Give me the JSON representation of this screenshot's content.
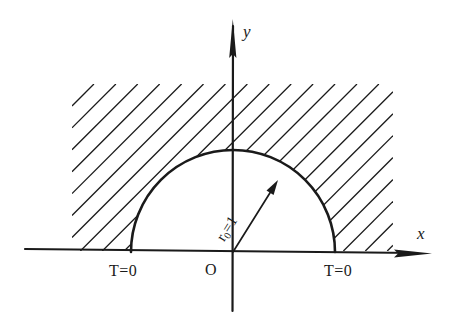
{
  "figure": {
    "type": "geometry-diagram",
    "background_color": "#ffffff",
    "ink_color": "#1a1a1a"
  },
  "axes": {
    "x_axis": {
      "label": "x",
      "arrow": "right-arrow-icon",
      "x_start": 25,
      "x_end": 432,
      "y_at_start": 249,
      "y_at_end": 253,
      "label_x": 417,
      "label_y": 225
    },
    "y_axis": {
      "label": "y",
      "arrow": "up-arrow-icon",
      "x": 233,
      "y_top": 20,
      "y_bottom": 311,
      "label_x": 243,
      "label_y": 23
    },
    "origin": {
      "label": "O",
      "x": 233,
      "y": 252,
      "label_x": 205,
      "label_y": 262
    }
  },
  "semicircle": {
    "center_x": 233,
    "center_y": 252,
    "radius": 102,
    "left_endpoint_x": 131,
    "right_endpoint_x": 335,
    "top_y": 150,
    "stroke_width": 2.6
  },
  "radius_arrow": {
    "label_text": "r",
    "label_subscript": "0",
    "label_equals": "=1",
    "full_label": "r0=1",
    "from_x": 233,
    "from_y": 252,
    "to_x": 278,
    "to_y": 180,
    "angle_deg": 58,
    "label_x": 228,
    "label_y": 228,
    "label_rotation_deg": -58
  },
  "hatching": {
    "style": "45-degree-diagonal-lines",
    "direction": "up-right",
    "spacing_px": 15.5,
    "stroke_width": 1.3,
    "region_left": 72,
    "region_right": 393,
    "region_top": 84,
    "region_bottom": 251,
    "meaning": "exterior region of the half disk in the upper half plane"
  },
  "boundary_conditions": [
    {
      "id": "bc-left",
      "text": "T=0",
      "x": 109,
      "y": 263,
      "position": "below x-axis, left of the half disk"
    },
    {
      "id": "bc-right",
      "text": "T=0",
      "x": 324,
      "y": 263,
      "position": "below x-axis, right of the half disk"
    }
  ]
}
